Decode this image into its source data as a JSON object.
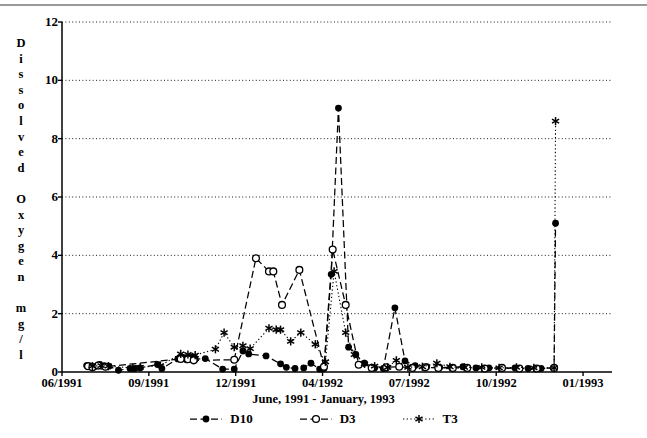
{
  "figure": {
    "top_rule": true,
    "plot_area": {
      "left": 62,
      "top": 22,
      "right": 612,
      "bottom": 372
    }
  },
  "axis_title_y_chars": [
    "D",
    "i",
    "s",
    "s",
    "o",
    "l",
    "v",
    "e",
    "d",
    "",
    "O",
    "x",
    "y",
    "g",
    "e",
    "n",
    "",
    "m",
    "g",
    "/",
    "l"
  ],
  "legend": {
    "position": "bottom-center",
    "entries": [
      {
        "label": "D10",
        "marker": "filled-circle",
        "line": "dashed",
        "color": "#000000"
      },
      {
        "label": "D3",
        "marker": "open-circle",
        "line": "dashed",
        "color": "#000000"
      },
      {
        "label": "T3",
        "marker": "asterisk",
        "line": "dotted",
        "color": "#000000"
      }
    ]
  },
  "chart_data": {
    "type": "line",
    "title": "",
    "xlabel": "June, 1991 - January, 1993",
    "ylabel": "Dissolved Oxygen mg/l",
    "grid": true,
    "ylim": [
      0,
      12
    ],
    "yticks": [
      0,
      2,
      4,
      6,
      8,
      10,
      12
    ],
    "xlim": [
      0,
      19
    ],
    "xticks": [
      0,
      3,
      6,
      9,
      12,
      15,
      18
    ],
    "xticklabels": [
      "06/1991",
      "09/1991",
      "12/1991",
      "04/1992",
      "07/1992",
      "10/1992",
      "01/1993"
    ],
    "series": [
      {
        "name": "D10",
        "marker": "filled-circle",
        "linestyle": "dashed",
        "points": [
          [
            0.85,
            0.22
          ],
          [
            1.0,
            0.2
          ],
          [
            1.12,
            0.18
          ],
          [
            1.3,
            0.26
          ],
          [
            1.45,
            0.22
          ],
          [
            1.62,
            0.2
          ],
          [
            1.95,
            0.06
          ],
          [
            2.35,
            0.12
          ],
          [
            2.52,
            0.12
          ],
          [
            2.7,
            0.14
          ],
          [
            3.3,
            0.26
          ],
          [
            3.45,
            0.12
          ],
          [
            4.0,
            0.45
          ],
          [
            4.18,
            0.5
          ],
          [
            4.3,
            0.42
          ],
          [
            4.45,
            0.52
          ],
          [
            4.6,
            0.44
          ],
          [
            4.95,
            0.46
          ],
          [
            5.55,
            0.1
          ],
          [
            5.95,
            0.1
          ],
          [
            6.25,
            0.72
          ],
          [
            6.45,
            0.62
          ],
          [
            7.05,
            0.55
          ],
          [
            7.55,
            0.28
          ],
          [
            7.75,
            0.16
          ],
          [
            8.05,
            0.12
          ],
          [
            8.35,
            0.14
          ],
          [
            8.6,
            0.3
          ],
          [
            8.9,
            0.1
          ],
          [
            9.05,
            0.12
          ],
          [
            9.3,
            3.35
          ],
          [
            9.55,
            9.05
          ],
          [
            9.9,
            0.85
          ],
          [
            10.15,
            0.6
          ],
          [
            10.45,
            0.3
          ],
          [
            10.8,
            0.14
          ],
          [
            11.1,
            0.12
          ],
          [
            11.5,
            2.2
          ],
          [
            11.85,
            0.38
          ],
          [
            12.2,
            0.22
          ],
          [
            12.6,
            0.18
          ],
          [
            13.05,
            0.16
          ],
          [
            13.45,
            0.16
          ],
          [
            13.85,
            0.18
          ],
          [
            14.3,
            0.14
          ],
          [
            14.75,
            0.14
          ],
          [
            15.2,
            0.12
          ],
          [
            15.65,
            0.14
          ],
          [
            16.1,
            0.12
          ],
          [
            16.55,
            0.12
          ],
          [
            17.0,
            0.14
          ],
          [
            17.05,
            5.1
          ]
        ]
      },
      {
        "name": "D3",
        "marker": "open-circle",
        "linestyle": "dashed",
        "points": [
          [
            0.9,
            0.2
          ],
          [
            1.05,
            0.16
          ],
          [
            1.25,
            0.22
          ],
          [
            1.5,
            0.18
          ],
          [
            4.1,
            0.45
          ],
          [
            4.35,
            0.44
          ],
          [
            4.55,
            0.4
          ],
          [
            5.95,
            0.42
          ],
          [
            6.7,
            3.9
          ],
          [
            7.15,
            3.45
          ],
          [
            7.3,
            3.45
          ],
          [
            7.6,
            2.3
          ],
          [
            8.2,
            3.5
          ],
          [
            9.05,
            0.18
          ],
          [
            9.35,
            4.2
          ],
          [
            9.8,
            2.3
          ],
          [
            10.25,
            0.25
          ],
          [
            10.7,
            0.14
          ],
          [
            11.2,
            0.16
          ],
          [
            11.65,
            0.18
          ],
          [
            12.1,
            0.14
          ],
          [
            12.55,
            0.16
          ],
          [
            13.0,
            0.14
          ],
          [
            13.5,
            0.14
          ],
          [
            14.0,
            0.14
          ],
          [
            14.6,
            0.12
          ],
          [
            15.2,
            0.14
          ],
          [
            15.8,
            0.12
          ],
          [
            16.4,
            0.12
          ],
          [
            17.0,
            0.14
          ]
        ]
      },
      {
        "name": "T3",
        "marker": "asterisk",
        "linestyle": "dotted",
        "points": [
          [
            1.05,
            0.2
          ],
          [
            1.35,
            0.22
          ],
          [
            1.6,
            0.2
          ],
          [
            2.45,
            0.14
          ],
          [
            2.7,
            0.16
          ],
          [
            3.4,
            0.22
          ],
          [
            4.1,
            0.62
          ],
          [
            4.35,
            0.6
          ],
          [
            4.6,
            0.58
          ],
          [
            5.3,
            0.78
          ],
          [
            5.6,
            1.35
          ],
          [
            5.95,
            0.85
          ],
          [
            6.25,
            0.9
          ],
          [
            6.5,
            0.8
          ],
          [
            7.15,
            1.5
          ],
          [
            7.4,
            1.45
          ],
          [
            7.55,
            1.45
          ],
          [
            7.9,
            1.05
          ],
          [
            8.25,
            1.35
          ],
          [
            8.75,
            0.95
          ],
          [
            9.1,
            0.35
          ],
          [
            9.4,
            3.45
          ],
          [
            9.8,
            1.35
          ],
          [
            10.1,
            0.6
          ],
          [
            10.45,
            0.28
          ],
          [
            10.8,
            0.2
          ],
          [
            11.25,
            0.16
          ],
          [
            11.55,
            0.4
          ],
          [
            11.95,
            0.16
          ],
          [
            12.45,
            0.18
          ],
          [
            12.95,
            0.3
          ],
          [
            13.4,
            0.18
          ],
          [
            13.9,
            0.16
          ],
          [
            14.5,
            0.16
          ],
          [
            15.1,
            0.14
          ],
          [
            15.7,
            0.16
          ],
          [
            16.3,
            0.14
          ],
          [
            17.0,
            0.14
          ],
          [
            17.05,
            8.6
          ]
        ]
      }
    ]
  }
}
